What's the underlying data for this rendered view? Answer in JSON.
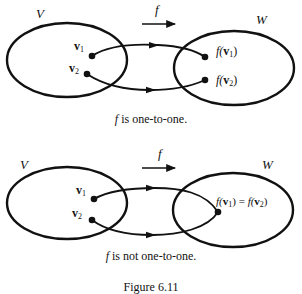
{
  "top_diagram": {
    "domain_label": "V",
    "codomain_label": "W",
    "map_label": "f",
    "points": [
      {
        "name": "v",
        "sub": "1",
        "image": "f(v1)"
      },
      {
        "name": "v",
        "sub": "2",
        "image": "f(v2)"
      }
    ],
    "image_labels": [
      {
        "prefix": "f(",
        "vec": "v",
        "sub": "1",
        "suffix": ")"
      },
      {
        "prefix": "f(",
        "vec": "v",
        "sub": "2",
        "suffix": ")"
      }
    ],
    "caption_func": "f",
    "caption_text": " is one-to-one."
  },
  "bottom_diagram": {
    "domain_label": "V",
    "codomain_label": "W",
    "map_label": "f",
    "points": [
      {
        "name": "v",
        "sub": "1"
      },
      {
        "name": "v",
        "sub": "2"
      }
    ],
    "merged_image_label": {
      "left": {
        "prefix": "f(",
        "vec": "v",
        "sub": "1",
        "suffix": ")"
      },
      "equals": " = ",
      "right": {
        "prefix": "f(",
        "vec": "v",
        "sub": "2",
        "suffix": ")"
      }
    },
    "caption_func": "f",
    "caption_text": " is not one-to-one."
  },
  "figure_caption": "Figure 6.11",
  "colors": {
    "stroke": "#111111",
    "background": "#ffffff"
  }
}
